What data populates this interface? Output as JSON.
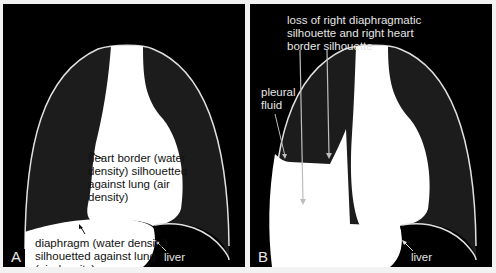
{
  "figure": {
    "panels": [
      {
        "id": "A",
        "letter": "A",
        "labels": {
          "heart_border": "heart border (water\ndensity) silhouetted\nagainst lung (air\ndensity)",
          "diaphragm": "diaphragm (water density)\nsilhouetted against lung\n(air density)",
          "liver": "liver"
        }
      },
      {
        "id": "B",
        "letter": "B",
        "labels": {
          "loss": "loss of right diaphragmatic\nsilhouette and right heart\nborder silhouette",
          "pleural_fluid": "pleural\nfluid",
          "liver": "liver"
        }
      }
    ],
    "colors": {
      "background": "#000000",
      "lung": "#1c1c1c",
      "water_density": "#ffffff",
      "outline": "#e0e0e0",
      "arrow": "#bdbdbd",
      "frame": "#f2f2f2"
    }
  }
}
